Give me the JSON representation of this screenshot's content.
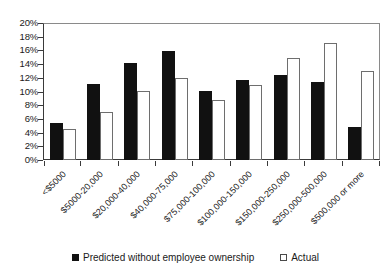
{
  "chart_data": {
    "type": "bar",
    "title": "",
    "subtitle": "",
    "xlabel": "",
    "ylabel": "",
    "ylim": [
      0,
      20
    ],
    "ytick_labels": [
      "20%",
      "18%",
      "16%",
      "14%",
      "12%",
      "10%",
      "8%",
      "6%",
      "4%",
      "2%",
      "0%"
    ],
    "ytick_values": [
      20,
      18,
      16,
      14,
      12,
      10,
      8,
      6,
      4,
      2,
      0
    ],
    "grid": false,
    "legend_position": "bottom",
    "categories": [
      "<$5000",
      "$5000-20,000",
      "$20,000-40,000",
      "$40,000-75,000",
      "$75,000-100,000",
      "$100,000-150,000",
      "$150,000-250,000",
      "$250,000-500,000",
      "$500,000 or more"
    ],
    "series": [
      {
        "name": "Predicted without employee ownership",
        "color": "#111111",
        "style": "filled",
        "values": [
          5.5,
          11.2,
          14.3,
          16.0,
          10.2,
          11.8,
          12.5,
          11.5,
          4.8
        ]
      },
      {
        "name": "Actual",
        "color": "#ffffff",
        "style": "hollow",
        "values": [
          4.5,
          7.0,
          10.1,
          12.1,
          8.8,
          11.0,
          15.0,
          17.2,
          13.1
        ]
      }
    ]
  },
  "legend": {
    "items": [
      {
        "label": "Predicted without employee ownership",
        "swatch": "filled-square-icon"
      },
      {
        "label": "Actual",
        "swatch": "hollow-square-icon"
      }
    ]
  }
}
